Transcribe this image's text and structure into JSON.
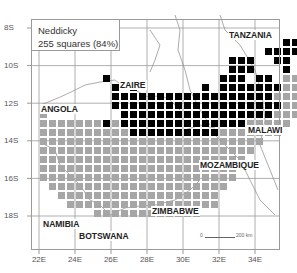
{
  "legend": {
    "species": "Neddicky",
    "summary": "255 squares (84%)"
  },
  "axes": {
    "latitude_labels": [
      "8S",
      "10S",
      "12S",
      "14S",
      "16S",
      "18S"
    ],
    "longitude_labels": [
      "22E",
      "24E",
      "26E",
      "28E",
      "30E",
      "32E",
      "34E"
    ]
  },
  "countries": {
    "tanzania": "TANZANIA",
    "zaire": "ZAIRE",
    "angola": "ANGOLA",
    "malawi": "MALAWI",
    "mozambique": "MOZAMBIQUE",
    "namibia": "NAMIBIA",
    "botswana": "BOTSWANA",
    "zimbabwe": "ZIMBABWE"
  },
  "scale_bar": {
    "start": "0",
    "end": "200 km"
  },
  "colors": {
    "recorded": "#000000",
    "not_recorded": "#a6a6a6",
    "grid": "#9a9a9a"
  },
  "grid_cells": {
    "description": "quarter-degree squares; rows from north (row 0 at ~9S) downward; col 0 at 22E",
    "black": [
      [
        0,
        23
      ],
      [
        0,
        24
      ],
      [
        1,
        27
      ],
      [
        1,
        28
      ],
      [
        2,
        25
      ],
      [
        2,
        26
      ],
      [
        2,
        27
      ],
      [
        2,
        28
      ],
      [
        3,
        21
      ],
      [
        3,
        22
      ],
      [
        3,
        23
      ],
      [
        3,
        26
      ],
      [
        3,
        27
      ],
      [
        4,
        21
      ],
      [
        4,
        22
      ],
      [
        4,
        23
      ],
      [
        4,
        27
      ],
      [
        4,
        30
      ],
      [
        5,
        7
      ],
      [
        5,
        20
      ],
      [
        5,
        21
      ],
      [
        5,
        22
      ],
      [
        5,
        24
      ],
      [
        5,
        25
      ],
      [
        6,
        8
      ],
      [
        6,
        10
      ],
      [
        6,
        18
      ],
      [
        6,
        20
      ],
      [
        6,
        21
      ],
      [
        6,
        22
      ],
      [
        6,
        23
      ],
      [
        6,
        24
      ],
      [
        6,
        25
      ],
      [
        6,
        26
      ],
      [
        7,
        8
      ],
      [
        7,
        9
      ],
      [
        7,
        10
      ],
      [
        7,
        11
      ],
      [
        7,
        12
      ],
      [
        7,
        13
      ],
      [
        7,
        14
      ],
      [
        7,
        15
      ],
      [
        7,
        16
      ],
      [
        7,
        17
      ],
      [
        7,
        18
      ],
      [
        7,
        19
      ],
      [
        7,
        20
      ],
      [
        7,
        21
      ],
      [
        7,
        22
      ],
      [
        7,
        23
      ],
      [
        7,
        24
      ],
      [
        7,
        25
      ],
      [
        8,
        8
      ],
      [
        8,
        9
      ],
      [
        8,
        10
      ],
      [
        8,
        11
      ],
      [
        8,
        12
      ],
      [
        8,
        13
      ],
      [
        8,
        14
      ],
      [
        8,
        15
      ],
      [
        8,
        16
      ],
      [
        8,
        17
      ],
      [
        8,
        18
      ],
      [
        8,
        19
      ],
      [
        8,
        20
      ],
      [
        8,
        21
      ],
      [
        8,
        22
      ],
      [
        8,
        23
      ],
      [
        8,
        24
      ],
      [
        8,
        25
      ],
      [
        8,
        26
      ],
      [
        9,
        9
      ],
      [
        9,
        10
      ],
      [
        9,
        11
      ],
      [
        9,
        12
      ],
      [
        9,
        13
      ],
      [
        9,
        14
      ],
      [
        9,
        15
      ],
      [
        9,
        16
      ],
      [
        9,
        17
      ],
      [
        9,
        18
      ],
      [
        9,
        19
      ],
      [
        9,
        20
      ],
      [
        9,
        21
      ],
      [
        9,
        22
      ],
      [
        9,
        23
      ],
      [
        9,
        24
      ],
      [
        9,
        25
      ],
      [
        10,
        7
      ],
      [
        10,
        9
      ],
      [
        10,
        10
      ],
      [
        10,
        11
      ],
      [
        10,
        12
      ],
      [
        10,
        13
      ],
      [
        10,
        14
      ],
      [
        10,
        15
      ],
      [
        10,
        16
      ],
      [
        10,
        17
      ],
      [
        10,
        18
      ],
      [
        10,
        19
      ],
      [
        10,
        20
      ],
      [
        10,
        21
      ],
      [
        10,
        22
      ],
      [
        11,
        10
      ],
      [
        11,
        11
      ],
      [
        11,
        12
      ],
      [
        11,
        13
      ],
      [
        11,
        14
      ],
      [
        11,
        15
      ],
      [
        11,
        16
      ],
      [
        11,
        17
      ],
      [
        11,
        18
      ],
      [
        11,
        19
      ]
    ]
  }
}
